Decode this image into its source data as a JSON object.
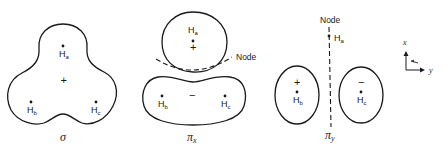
{
  "figure": {
    "stroke_color": "#1a1a1a",
    "background": "#ffffff"
  },
  "sigma": {
    "label": "σ",
    "center_sign": "+",
    "atoms": {
      "a": {
        "symbol": "H",
        "sub": "a"
      },
      "b": {
        "symbol": "H",
        "sub": "b"
      },
      "c": {
        "symbol": "H",
        "sub": "c"
      }
    }
  },
  "pi_x": {
    "label": "π",
    "label_sub": "x",
    "node_label": "Node",
    "top_lobe": {
      "sign": "+",
      "atom": {
        "symbol": "H",
        "sub": "a"
      }
    },
    "bottom_lobe": {
      "sign": "−",
      "atoms": {
        "b": {
          "symbol": "H",
          "sub": "b"
        },
        "c": {
          "symbol": "H",
          "sub": "c"
        }
      }
    }
  },
  "pi_y": {
    "label": "π",
    "label_sub": "y",
    "node_label": "Node",
    "node_atom": {
      "symbol": "H",
      "sub": "a"
    },
    "left_lobe": {
      "sign": "+",
      "atom": {
        "symbol": "H",
        "sub": "b"
      }
    },
    "right_lobe": {
      "sign": "−",
      "atom": {
        "symbol": "H",
        "sub": "c"
      }
    }
  },
  "axes": {
    "vertical": "x",
    "horizontal": "y"
  }
}
